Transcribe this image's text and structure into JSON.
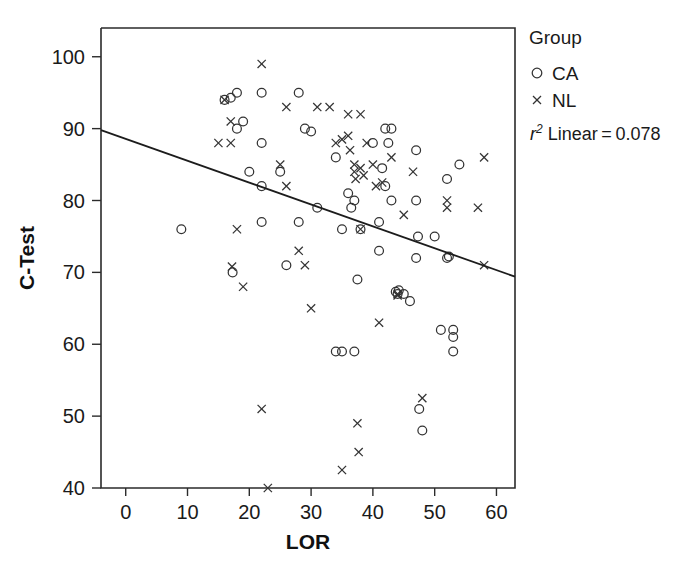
{
  "chart_data": {
    "type": "scatter",
    "title": "",
    "xlabel": "LOR",
    "ylabel": "C-Test",
    "xlim": [
      -4,
      63
    ],
    "ylim": [
      40,
      104
    ],
    "xticks": [
      0,
      10,
      20,
      30,
      40,
      50,
      60
    ],
    "yticks": [
      40,
      50,
      60,
      70,
      80,
      90,
      100
    ],
    "grid": false,
    "legend_position": "right",
    "legend_title": "Group",
    "series": [
      {
        "name": "CA",
        "marker": "circle",
        "points": [
          [
            9,
            76
          ],
          [
            16,
            94
          ],
          [
            17,
            94.3
          ],
          [
            18,
            95
          ],
          [
            18,
            90
          ],
          [
            19,
            91
          ],
          [
            20,
            84
          ],
          [
            22,
            95
          ],
          [
            22,
            82
          ],
          [
            22,
            88
          ],
          [
            22,
            77
          ],
          [
            17.3,
            70
          ],
          [
            25,
            84
          ],
          [
            26,
            71
          ],
          [
            28,
            95
          ],
          [
            28,
            77
          ],
          [
            29,
            90
          ],
          [
            30,
            89.6
          ],
          [
            31,
            79
          ],
          [
            34,
            86
          ],
          [
            34,
            59
          ],
          [
            35,
            76
          ],
          [
            36,
            81
          ],
          [
            36.5,
            79
          ],
          [
            37,
            80
          ],
          [
            37,
            59
          ],
          [
            37.5,
            69
          ],
          [
            38,
            76
          ],
          [
            40,
            88
          ],
          [
            41,
            77
          ],
          [
            41,
            73
          ],
          [
            41.5,
            84.5
          ],
          [
            42,
            90
          ],
          [
            42,
            82
          ],
          [
            42.5,
            88
          ],
          [
            43,
            90
          ],
          [
            43,
            80
          ],
          [
            43.7,
            67.3
          ],
          [
            44,
            67
          ],
          [
            44.2,
            67.5
          ],
          [
            45,
            67
          ],
          [
            46,
            66
          ],
          [
            47,
            80
          ],
          [
            47,
            72
          ],
          [
            47,
            87
          ],
          [
            47.3,
            75
          ],
          [
            47.5,
            51
          ],
          [
            48,
            48
          ],
          [
            50,
            75
          ],
          [
            51,
            62
          ],
          [
            52,
            83
          ],
          [
            52,
            72
          ],
          [
            52.3,
            72.2
          ],
          [
            53,
            61
          ],
          [
            53,
            62
          ],
          [
            53,
            59
          ],
          [
            54,
            85
          ],
          [
            35,
            59
          ]
        ]
      },
      {
        "name": "NL",
        "marker": "cross",
        "points": [
          [
            16,
            94
          ],
          [
            17,
            91
          ],
          [
            15,
            88
          ],
          [
            17,
            88
          ],
          [
            18,
            76
          ],
          [
            17.2,
            70.8
          ],
          [
            19,
            68
          ],
          [
            22,
            99
          ],
          [
            22,
            51
          ],
          [
            23,
            40
          ],
          [
            25,
            85
          ],
          [
            26,
            82
          ],
          [
            26,
            93
          ],
          [
            28,
            73
          ],
          [
            29,
            71
          ],
          [
            30,
            65
          ],
          [
            31,
            93
          ],
          [
            33,
            93
          ],
          [
            34,
            88
          ],
          [
            35,
            88.5
          ],
          [
            36,
            92
          ],
          [
            36,
            89
          ],
          [
            36.3,
            87
          ],
          [
            37,
            84
          ],
          [
            37,
            85
          ],
          [
            37.2,
            83
          ],
          [
            37.5,
            49
          ],
          [
            37.7,
            45
          ],
          [
            35,
            42.5
          ],
          [
            38,
            92
          ],
          [
            38,
            84.5
          ],
          [
            38,
            76
          ],
          [
            38.5,
            83.5
          ],
          [
            39,
            88
          ],
          [
            40,
            85
          ],
          [
            40.5,
            82
          ],
          [
            41,
            63
          ],
          [
            41.5,
            82.5
          ],
          [
            43,
            86
          ],
          [
            44,
            67
          ],
          [
            45,
            78
          ],
          [
            46.5,
            84
          ],
          [
            48,
            52.5
          ],
          [
            52,
            80
          ],
          [
            52,
            79
          ],
          [
            57,
            79
          ],
          [
            58,
            86
          ],
          [
            58,
            71
          ],
          [
            44,
            66.8
          ]
        ]
      }
    ],
    "fit_line": {
      "label": "r² Linear = 0.078",
      "r_squared": 0.078,
      "x_start": -4,
      "y_start": 89.8,
      "x_end": 63,
      "y_end": 69.4
    }
  },
  "legend": {
    "title": "Group",
    "items": [
      {
        "marker": "circle",
        "label": "CA"
      },
      {
        "marker": "cross",
        "label": "NL"
      }
    ],
    "stat_prefix": "r",
    "stat_superscript": "2",
    "stat_text": " Linear = 0.078"
  },
  "axes": {
    "x_title": "LOR",
    "y_title": "C-Test",
    "x_tick_labels": [
      "0",
      "10",
      "20",
      "30",
      "40",
      "50",
      "60"
    ],
    "y_tick_labels": [
      "40",
      "50",
      "60",
      "70",
      "80",
      "90",
      "100"
    ]
  }
}
